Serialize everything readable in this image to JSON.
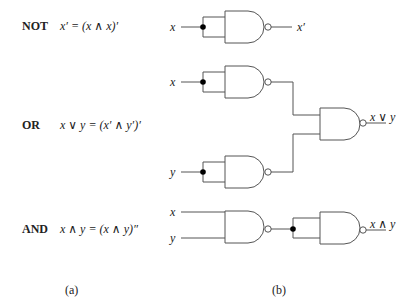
{
  "panel_a": {
    "rows": [
      {
        "op": "NOT",
        "formula": "x′ = (x ∧ x)′"
      },
      {
        "op": "OR",
        "formula": "x ∨ y = (x′ ∧ y′)′"
      },
      {
        "op": "AND",
        "formula": "x ∧ y = (x ∧ y)″"
      }
    ],
    "caption": "(a)"
  },
  "panel_b": {
    "not_circuit": {
      "input": "x",
      "output": "x′"
    },
    "or_circuit": {
      "input_top": "x",
      "input_bottom": "y",
      "output": "x ∨ y"
    },
    "and_circuit": {
      "input_top": "x",
      "input_bottom": "y",
      "output": "x ∧ y"
    },
    "caption": "(b)"
  },
  "colors": {
    "wire": "#555555",
    "junction": "#000000",
    "background": "#ffffff"
  }
}
